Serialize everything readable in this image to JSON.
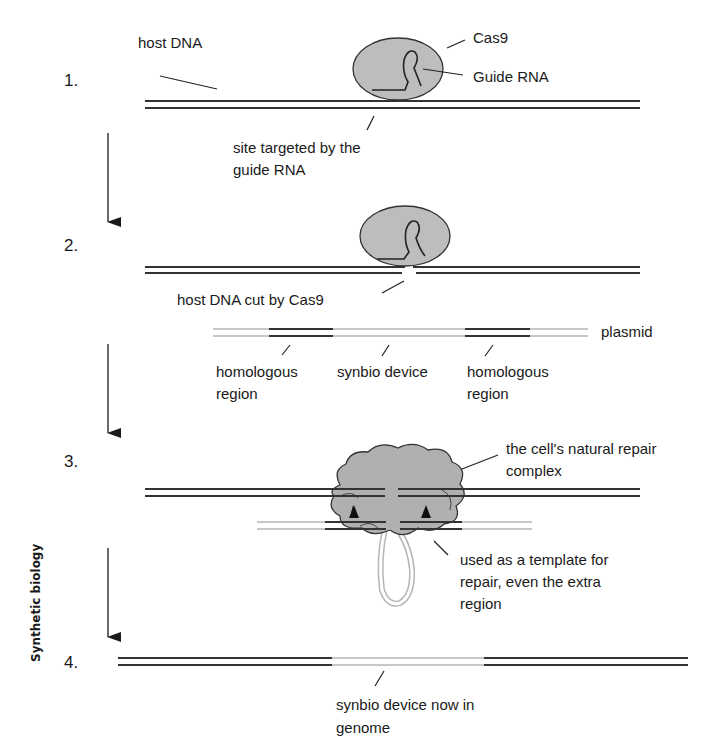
{
  "sidebar": {
    "title": "Synthetic biology"
  },
  "steps": [
    {
      "number": "1."
    },
    {
      "number": "2."
    },
    {
      "number": "3."
    },
    {
      "number": "4."
    }
  ],
  "labels": {
    "host_dna": "host DNA",
    "cas9": "Cas9",
    "guide_rna": "Guide RNA",
    "site_targeted_line1": "site targeted by the",
    "site_targeted_line2": "guide RNA",
    "dna_cut": "host DNA cut by Cas9",
    "plasmid": "plasmid",
    "homologous_left_line1": "homologous",
    "homologous_left_line2": "region",
    "synbio_device": "synbio device",
    "homologous_right_line1": "homologous",
    "homologous_right_line2": "region",
    "repair_complex_line1": "the cell's natural repair",
    "repair_complex_line2": "complex",
    "template_line1": "used as a template for",
    "template_line2": "repair, even the extra",
    "template_line3": "region",
    "genome_line1": "synbio device now in",
    "genome_line2": "genome"
  },
  "colors": {
    "protein_fill": "#bdbdbd",
    "dna_dark": "#333333",
    "dna_light": "#b5b5b5"
  }
}
